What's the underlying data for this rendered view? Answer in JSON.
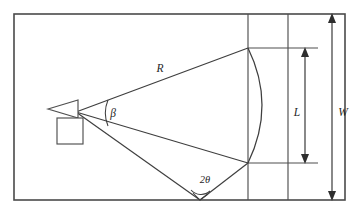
{
  "figure": {
    "name": "antenna-beam-coverage-diagram",
    "type": "geometric-schematic",
    "background_color": "#ffffff",
    "line_color": "#4a4a4a",
    "label_color": "#1f1f1f"
  },
  "labels": {
    "range": "R",
    "beta_angle": "β",
    "two_theta_angle": "2θ",
    "length": "L",
    "width": "W"
  },
  "label_positions": {
    "range": {
      "x": 160,
      "y": 72
    },
    "beta_angle": {
      "x": 113,
      "y": 115
    },
    "two_theta_angle": {
      "x": 205,
      "y": 184
    },
    "length": {
      "x": 301,
      "y": 112
    },
    "width": {
      "x": 340,
      "y": 112
    }
  },
  "geometry": {
    "outer_rect": {
      "x": 14,
      "y": 14,
      "width": 331,
      "height": 186
    },
    "apex": {
      "x": 76,
      "y": 112
    },
    "upper_ray_end": {
      "x": 248,
      "y": 48
    },
    "middle_ray_end": {
      "x": 248,
      "y": 163
    },
    "lower_ray_end": {
      "x": 200,
      "y": 200
    },
    "arc_top": {
      "x": 248,
      "y": 48
    },
    "arc_bottom": {
      "x": 248,
      "y": 163
    },
    "arc_bulge_x": 272,
    "vertical_line_1_x": 248,
    "vertical_line_2_x": 288,
    "dim_line_L_x": 305,
    "dim_line_W_x": 332,
    "dim_L_top_y": 48,
    "dim_L_bottom_y": 163,
    "dim_W_top_y": 14,
    "dim_W_bottom_y": 200,
    "source_triangle": {
      "tip_x": 48,
      "back_x": 78,
      "top_y": 100,
      "bottom_y": 118
    },
    "source_square": {
      "x": 57,
      "y": 118,
      "size": 26
    }
  },
  "annotations": {
    "beta_arc_radius": 32,
    "two_theta_arc_radius": 13,
    "right_angle_marker": true
  }
}
